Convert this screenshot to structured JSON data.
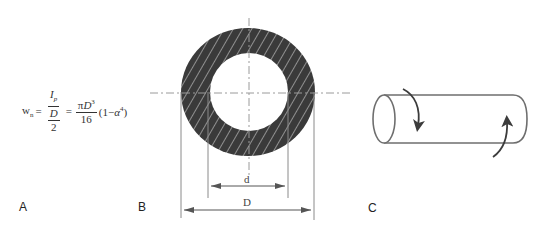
{
  "figure": {
    "panels": [
      {
        "id": "A",
        "label": "A"
      },
      {
        "id": "B",
        "label": "B"
      },
      {
        "id": "C",
        "label": "C"
      }
    ]
  },
  "formula": {
    "lhs": "w",
    "lhs_sub": "n",
    "equals": "=",
    "frac1_num": "I",
    "frac1_num_sub": "p",
    "frac1_den_num": "D",
    "frac1_den_den": "2",
    "frac2_num_pi": "π",
    "frac2_num_var": "D",
    "frac2_num_exp": "3",
    "frac2_den": "16",
    "factor_open": "(1−",
    "factor_var": "α",
    "factor_exp": "4",
    "factor_close": ")"
  },
  "cross_section": {
    "inner_diameter_label": "d",
    "outer_diameter_label": "D",
    "fill_color": "#3a3a3a",
    "hatch_color": "#9a9a9a",
    "line_color": "#8a8a8a"
  },
  "cylinder": {
    "outline_color": "#6e6e6e",
    "arrow_color": "#3c3c3c",
    "torque_arrows": [
      "clockwise-torque-left",
      "counter-torque-right"
    ]
  }
}
